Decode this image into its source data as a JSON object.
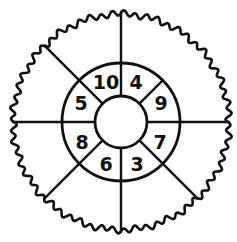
{
  "figure": {
    "name": "segmented-wheel-diagram",
    "stroke_color": "#111111",
    "fill_color": "#ffffff",
    "background_color": "#ffffff",
    "center": {
      "x": 121,
      "y": 122
    },
    "radii": {
      "outer": 108,
      "middle": 59,
      "inner": 26
    },
    "outer_rim": {
      "name": "scalloped-outer-rim",
      "wave_count": 60,
      "wave_amplitude": 2.6,
      "stroke_width": 2.6
    },
    "middle_ring": {
      "name": "middle-ring",
      "stroke_width": 2.6,
      "spoke_angles_deg": [
        0,
        90,
        135,
        180,
        225,
        315
      ],
      "segment_count": 6
    },
    "inner_ring": {
      "name": "inner-numbered-ring",
      "stroke_width": 2.6,
      "divider_angles_deg": [
        0,
        45,
        90,
        135,
        180,
        225,
        270,
        315
      ],
      "segment_count": 8
    },
    "hub": {
      "name": "center-hub",
      "stroke_width": 2.6,
      "label": ""
    }
  },
  "chart_data": {
    "type": "pie",
    "title": "",
    "subtitle": "",
    "xlabel": "",
    "ylabel": "",
    "legend": [],
    "annotations": [],
    "grid": false,
    "rings": [
      {
        "name": "outer-ring",
        "labelled": false,
        "segments": [
          {
            "id": "outer-seg-1",
            "start_deg": 0,
            "end_deg": 90,
            "label": ""
          },
          {
            "id": "outer-seg-2",
            "start_deg": 90,
            "end_deg": 135,
            "label": ""
          },
          {
            "id": "outer-seg-3",
            "start_deg": 135,
            "end_deg": 180,
            "label": ""
          },
          {
            "id": "outer-seg-4",
            "start_deg": 180,
            "end_deg": 225,
            "label": ""
          },
          {
            "id": "outer-seg-5",
            "start_deg": 225,
            "end_deg": 315,
            "label": ""
          },
          {
            "id": "outer-seg-6",
            "start_deg": 315,
            "end_deg": 360,
            "label": ""
          }
        ]
      },
      {
        "name": "inner-ring",
        "labelled": true,
        "segments": [
          {
            "id": "inner-seg-4",
            "start_deg": 45,
            "end_deg": 90,
            "label": "4",
            "position": "top-right"
          },
          {
            "id": "inner-seg-10",
            "start_deg": 90,
            "end_deg": 135,
            "label": "10",
            "position": "top-left"
          },
          {
            "id": "inner-seg-5",
            "start_deg": 135,
            "end_deg": 180,
            "label": "5",
            "position": "left-upper"
          },
          {
            "id": "inner-seg-8",
            "start_deg": 180,
            "end_deg": 225,
            "label": "8",
            "position": "left-lower"
          },
          {
            "id": "inner-seg-6",
            "start_deg": 225,
            "end_deg": 270,
            "label": "6",
            "position": "bottom-left"
          },
          {
            "id": "inner-seg-3",
            "start_deg": 270,
            "end_deg": 315,
            "label": "3",
            "position": "bottom-right"
          },
          {
            "id": "inner-seg-7",
            "start_deg": 315,
            "end_deg": 360,
            "label": "7",
            "position": "right-lower"
          },
          {
            "id": "inner-seg-9",
            "start_deg": 0,
            "end_deg": 45,
            "label": "9",
            "position": "right-upper"
          }
        ]
      }
    ],
    "categories": [
      "4",
      "10",
      "5",
      "8",
      "6",
      "3",
      "7",
      "9"
    ],
    "values": [
      4,
      10,
      5,
      8,
      6,
      3,
      7,
      9
    ],
    "value_labels": [
      "4",
      "10",
      "5",
      "8",
      "6",
      "3",
      "7",
      "9"
    ]
  },
  "labels": {
    "n10": "10",
    "n4": "4",
    "n9": "9",
    "n7": "7",
    "n3": "3",
    "n6": "6",
    "n8": "8",
    "n5": "5"
  }
}
